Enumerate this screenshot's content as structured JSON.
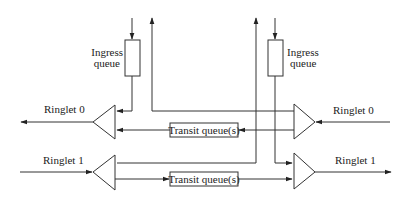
{
  "diagram": {
    "colors": {
      "line": "#333333",
      "text": "#222222",
      "background": "#ffffff"
    },
    "labels": {
      "ringlet0_left": "Ringlet 0",
      "ringlet1_left": "Ringlet 1",
      "ringlet0_right": "Ringlet 0",
      "ringlet1_right": "Ringlet 1",
      "ingress_left_line1": "Ingress",
      "ingress_left_line2": "queue",
      "ingress_right_line1": "Ingress",
      "ingress_right_line2": "queue",
      "transit_top": "Transit queue(s)",
      "transit_bottom": "Transit queue(s)"
    },
    "nodes": [
      {
        "id": "ingress-queue-left",
        "type": "queue",
        "label": "Ingress queue"
      },
      {
        "id": "ingress-queue-right",
        "type": "queue",
        "label": "Ingress queue"
      },
      {
        "id": "transit-queue-ringlet0",
        "type": "queue",
        "label": "Transit queue(s)"
      },
      {
        "id": "transit-queue-ringlet1",
        "type": "queue",
        "label": "Transit queue(s)"
      },
      {
        "id": "mux-ringlet0-out",
        "type": "triangle",
        "direction": "left"
      },
      {
        "id": "demux-ringlet1-in",
        "type": "triangle",
        "direction": "left"
      },
      {
        "id": "demux-ringlet0-in",
        "type": "triangle",
        "direction": "right"
      },
      {
        "id": "mux-ringlet1-out",
        "type": "triangle",
        "direction": "right"
      }
    ],
    "edges": [
      {
        "from": "ringlet0-in",
        "to": "demux-ringlet0-in"
      },
      {
        "from": "demux-ringlet0-in",
        "to": "transit-queue-ringlet0"
      },
      {
        "from": "demux-ringlet0-in",
        "to": "egress-up-left"
      },
      {
        "from": "transit-queue-ringlet0",
        "to": "mux-ringlet0-out"
      },
      {
        "from": "ingress-queue-left",
        "to": "mux-ringlet0-out"
      },
      {
        "from": "mux-ringlet0-out",
        "to": "ringlet0-out"
      },
      {
        "from": "ringlet1-in",
        "to": "demux-ringlet1-in"
      },
      {
        "from": "demux-ringlet1-in",
        "to": "transit-queue-ringlet1"
      },
      {
        "from": "demux-ringlet1-in",
        "to": "egress-up-right"
      },
      {
        "from": "transit-queue-ringlet1",
        "to": "mux-ringlet1-out"
      },
      {
        "from": "ingress-queue-right",
        "to": "mux-ringlet1-out"
      },
      {
        "from": "mux-ringlet1-out",
        "to": "ringlet1-out"
      }
    ]
  }
}
